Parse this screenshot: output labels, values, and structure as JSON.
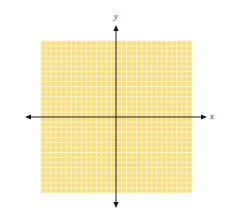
{
  "diagram": {
    "type": "coordinate-plane",
    "grid": {
      "left": 41,
      "top": 41,
      "width": 151,
      "height": 152,
      "columns": 30,
      "rows": 30,
      "fill_color": "#f6df7c",
      "line_color": "#fdf6d8"
    },
    "axes": {
      "origin_x": 116,
      "origin_y": 117,
      "x_axis": {
        "label": "x",
        "left_tip": 25,
        "right_tip": 207
      },
      "y_axis": {
        "label": "y",
        "top_tip": 25,
        "bottom_tip": 208
      },
      "color": "#1a1a1a"
    }
  }
}
